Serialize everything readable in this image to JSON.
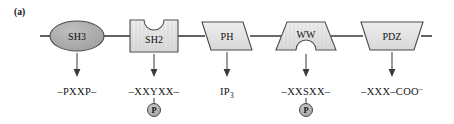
{
  "figure": {
    "panel_label": "(a)",
    "width": 454,
    "height": 124,
    "background_color": "#ffffff"
  },
  "colors": {
    "backbone_stroke": "#3a3a3a",
    "shape_outline": "#4a4a4a",
    "shape_fill_light": "#e2e2e2",
    "shape_fill_dark": "#a9a9a9",
    "phospho_fill": "#b0b0b0",
    "text": "#111111"
  },
  "backbone": {
    "left_x": 40,
    "right_x": 432,
    "y": 36
  },
  "domains": [
    {
      "id": "sh3",
      "label": "SH3",
      "shape": "ellipse",
      "fill": "#a9a9a9",
      "cx": 77,
      "cy": 36,
      "rx": 27,
      "ry": 15
    },
    {
      "id": "sh2",
      "label": "SH2",
      "shape": "rect-notch-top",
      "fill": "#e2e2e2",
      "cx": 154,
      "cy": 36,
      "half_width": 24,
      "half_height": 16,
      "notch_radius": 10
    },
    {
      "id": "ph",
      "label": "PH",
      "shape": "parallelogram",
      "fill": "#e2e2e2",
      "cx": 227,
      "cy": 36,
      "half_width": 25,
      "half_height": 14,
      "slant": 9
    },
    {
      "id": "ww",
      "label": "WW",
      "shape": "trapezoid-wide-bottom-notch",
      "fill": "#e2e2e2",
      "cx": 306,
      "cy": 36,
      "half_width_top": 19,
      "half_width_bottom": 30,
      "half_height": 14,
      "notch_radius": 10
    },
    {
      "id": "pdz",
      "label": "PDZ",
      "shape": "trapezoid-narrow-bottom",
      "fill": "#e2e2e2",
      "cx": 392,
      "cy": 36,
      "half_width_top": 31,
      "half_width_bottom": 22,
      "half_height": 14
    }
  ],
  "arrows": [
    {
      "id": "arrow-sh3",
      "x": 77,
      "y_start": 52,
      "y_end": 75
    },
    {
      "id": "arrow-sh2",
      "x": 154,
      "y_start": 54,
      "y_end": 75
    },
    {
      "id": "arrow-ph",
      "x": 227,
      "y_start": 52,
      "y_end": 75
    },
    {
      "id": "arrow-ww",
      "x": 306,
      "y_start": 54,
      "y_end": 75
    },
    {
      "id": "arrow-pdz",
      "x": 392,
      "y_start": 52,
      "y_end": 75
    }
  ],
  "ligands": [
    {
      "id": "ligand-sh3",
      "for_domain": "sh3",
      "text": "–PXXP–",
      "x": 77,
      "y": 92,
      "has_phosphate": false
    },
    {
      "id": "ligand-sh2",
      "for_domain": "sh2",
      "text": "–XXYXX–",
      "x": 154,
      "y": 92,
      "has_phosphate": true
    },
    {
      "id": "ligand-ph",
      "for_domain": "ph",
      "text": "IP",
      "subscript": "3",
      "x": 227,
      "y": 92,
      "has_phosphate": false
    },
    {
      "id": "ligand-ww",
      "for_domain": "ww",
      "text": "–XXSXX–",
      "x": 306,
      "y": 92,
      "has_phosphate": true
    },
    {
      "id": "ligand-pdz",
      "for_domain": "pdz",
      "text": "–XXX–COO",
      "superscript": "–",
      "x": 392,
      "y": 92,
      "has_phosphate": false
    }
  ],
  "phosphates": [
    {
      "id": "phospho-sh2",
      "label": "P",
      "cx": 154,
      "cy": 110,
      "r": 6.5,
      "stem_y_start": 96,
      "stem_y_end": 103.5
    },
    {
      "id": "phospho-ww",
      "label": "P",
      "cx": 306,
      "cy": 110,
      "r": 6.5,
      "stem_y_start": 96,
      "stem_y_end": 103.5
    }
  ]
}
